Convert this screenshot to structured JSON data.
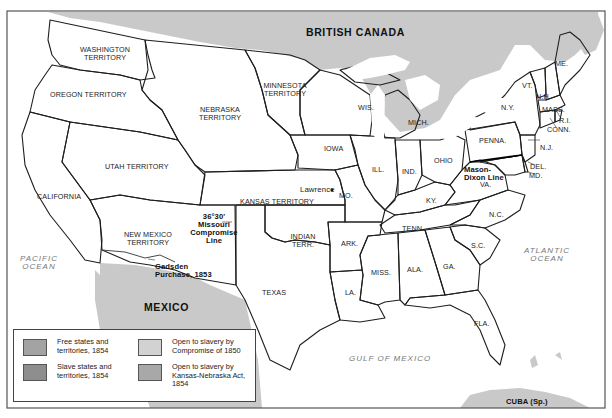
{
  "map": {
    "title_regions": {
      "north": "BRITISH CANADA",
      "south": "MEXICO",
      "cuba": "CUBA (Sp.)"
    },
    "oceans": {
      "pacific": "PACIFIC OCEAN",
      "atlantic": "ATLANTIC OCEAN",
      "gulf": "GULF OF MEXICO"
    },
    "territories": {
      "washington": "WASHINGTON TERRITORY",
      "oregon": "OREGON TERRITORY",
      "nebraska": "NEBRASKA TERRITORY",
      "minnesota": "MINNESOTA TERRITORY",
      "utah": "UTAH TERRITORY",
      "kansas": "KANSAS TERRITORY",
      "new_mexico": "NEW MEXICO TERRITORY",
      "indian": "INDIAN TERR."
    },
    "states": {
      "california": "CALIFORNIA",
      "texas": "TEXAS",
      "iowa": "IOWA",
      "wis": "WIS.",
      "mich": "MICH.",
      "ill": "ILL.",
      "ind": "IND.",
      "ohio": "OHIO",
      "mo": "MO.",
      "ark": "ARK.",
      "la": "LA.",
      "miss": "MISS.",
      "ala": "ALA.",
      "ga": "GA.",
      "fla": "FLA.",
      "sc": "S.C.",
      "nc": "N.C.",
      "tenn": "TENN.",
      "ky": "KY.",
      "va": "VA.",
      "penna": "PENNA.",
      "ny": "N.Y.",
      "vt": "VT.",
      "nh": "N.H.",
      "me": "ME.",
      "mass": "MASS.",
      "ri": "R.I.",
      "conn": "CONN.",
      "nj": "N.J.",
      "del": "DEL.",
      "md": "MD."
    },
    "annotations": {
      "lawrence": "Lawrence",
      "missouri_line_1": "36°30'",
      "missouri_line_2": "Missouri",
      "missouri_line_3": "Compromise",
      "missouri_line_4": "Line",
      "gadsden_1": "Gadsden",
      "gadsden_2": "Purchase, 1853",
      "mason_1": "Mason-",
      "mason_2": "Dixon Line"
    }
  },
  "legend": {
    "items": [
      {
        "label": "Free states and territories, 1854",
        "color": "#a3a3a3"
      },
      {
        "label": "Slave states and territories, 1854",
        "color": "#8e8e8e"
      },
      {
        "label": "Open to slavery by Compromise of 1850",
        "color": "#d2d2d2"
      },
      {
        "label": "Open to slavery by Kansas-Nebraska Act, 1854",
        "color": "#a8a8a8"
      }
    ]
  }
}
